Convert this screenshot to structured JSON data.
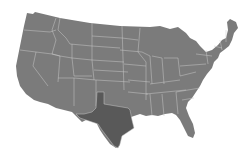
{
  "map": {
    "title": "United States",
    "region": "Contiguous United States",
    "colors": {
      "background": "#ffffff",
      "state_fill": "#7b7b7b",
      "highlight_fill": "#595959",
      "border": "#c8c8c8"
    },
    "highlighted_state": "Texas"
  }
}
